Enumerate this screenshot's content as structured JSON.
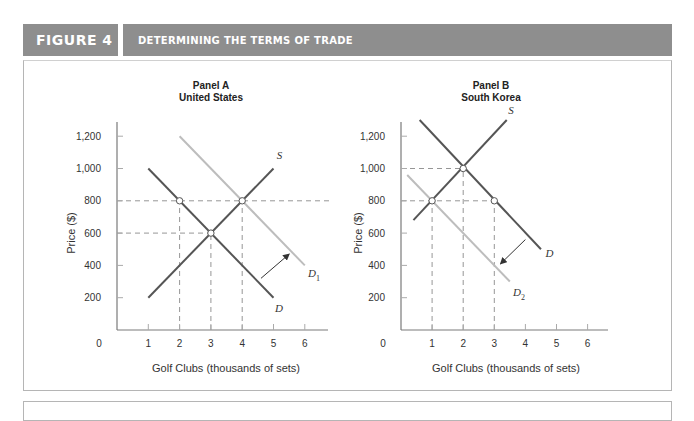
{
  "header": {
    "figure_label": "FIGURE 4",
    "title": "DETERMINING THE TERMS OF TRADE"
  },
  "colors": {
    "header_bg": "#8e8e8e",
    "dark_curve": "#555555",
    "light_curve": "#bdbdbd",
    "axis": "#7a7a7a",
    "dashed": "#8a8a8a"
  },
  "chart_data": [
    {
      "type": "line",
      "title": "Panel A",
      "subtitle": "United States",
      "xlabel": "Golf Clubs (thousands of sets)",
      "ylabel": "Price ($)",
      "xlim": [
        0,
        6.8
      ],
      "ylim": [
        0,
        1300
      ],
      "xticks": [
        0,
        1,
        2,
        3,
        4,
        5,
        6
      ],
      "yticks": [
        200,
        400,
        600,
        800,
        1000,
        1200
      ],
      "ytick_labels": [
        "200",
        "400",
        "600",
        "800",
        "1,000",
        "1,200"
      ],
      "grid": false,
      "series": [
        {
          "name": "S",
          "style": "dark",
          "points": [
            [
              1,
              200
            ],
            [
              5,
              1000
            ]
          ],
          "label_pos": [
            5.1,
            1060
          ]
        },
        {
          "name": "D",
          "style": "dark",
          "points": [
            [
              1,
              1000
            ],
            [
              5,
              200
            ]
          ],
          "label_pos": [
            5.05,
            110
          ]
        },
        {
          "name": "D1",
          "label_main": "D",
          "label_sub": "1",
          "style": "light",
          "points": [
            [
              2,
              1200
            ],
            [
              6,
              400
            ]
          ],
          "label_pos": [
            6.1,
            330
          ]
        }
      ],
      "points_of_interest": [
        {
          "x": 2,
          "y": 800,
          "label": "domestic demand at world price"
        },
        {
          "x": 3,
          "y": 600,
          "label": "no-trade equilibrium"
        },
        {
          "x": 4,
          "y": 800,
          "label": "new equilibrium / supply at world price"
        }
      ],
      "guides": {
        "horizontal": [
          {
            "y": 800,
            "from_x": 0,
            "to_x": 6.8
          },
          {
            "y": 600,
            "from_x": 0,
            "to_x": 3
          }
        ],
        "vertical": [
          {
            "x": 2,
            "from_y": 0,
            "to_y": 800
          },
          {
            "x": 3,
            "from_y": 0,
            "to_y": 600
          },
          {
            "x": 4,
            "from_y": 0,
            "to_y": 800
          }
        ]
      },
      "shift_arrow": {
        "from": [
          4.6,
          320
        ],
        "to": [
          5.5,
          470
        ],
        "direction": "right"
      }
    },
    {
      "type": "line",
      "title": "Panel B",
      "subtitle": "South Korea",
      "xlabel": "Golf Clubs (thousands of sets)",
      "ylabel": "Price ($)",
      "xlim": [
        0,
        6.8
      ],
      "ylim": [
        0,
        1300
      ],
      "xticks": [
        0,
        1,
        2,
        3,
        4,
        5,
        6
      ],
      "yticks": [
        200,
        400,
        600,
        800,
        1000,
        1200
      ],
      "ytick_labels": [
        "200",
        "400",
        "600",
        "800",
        "1,000",
        "1,200"
      ],
      "grid": false,
      "series": [
        {
          "name": "S",
          "style": "dark",
          "points": [
            [
              0.4,
              680
            ],
            [
              3.4,
              1300
            ]
          ],
          "label_pos": [
            3.45,
            1340
          ]
        },
        {
          "name": "D",
          "style": "dark",
          "points": [
            [
              0.6,
              1300
            ],
            [
              4.5,
              500
            ]
          ],
          "label_pos": [
            4.65,
            450
          ]
        },
        {
          "name": "D2",
          "label_main": "D",
          "label_sub": "2",
          "style": "light",
          "points": [
            [
              0.2,
              960
            ],
            [
              3.5,
              300
            ]
          ],
          "label_pos": [
            3.6,
            210
          ]
        }
      ],
      "points_of_interest": [
        {
          "x": 1,
          "y": 800,
          "label": "supply at world price"
        },
        {
          "x": 2,
          "y": 1000,
          "label": "no-trade equilibrium"
        },
        {
          "x": 3,
          "y": 800,
          "label": "domestic demand at world price"
        }
      ],
      "guides": {
        "horizontal": [
          {
            "y": 1000,
            "from_x": 0,
            "to_x": 2
          },
          {
            "y": 800,
            "from_x": 0,
            "to_x": 3
          }
        ],
        "vertical": [
          {
            "x": 1,
            "from_y": 0,
            "to_y": 800
          },
          {
            "x": 2,
            "from_y": 0,
            "to_y": 1000
          },
          {
            "x": 3,
            "from_y": 0,
            "to_y": 800
          }
        ]
      },
      "shift_arrow": {
        "from": [
          4.0,
          560
        ],
        "to": [
          3.2,
          410
        ],
        "direction": "left"
      }
    }
  ],
  "panels": {
    "a": {
      "title": "Panel A",
      "subtitle": "United States",
      "ylabel": "Price ($)",
      "xlabel": "Golf Clubs (thousands of sets)"
    },
    "b": {
      "title": "Panel B",
      "subtitle": "South Korea",
      "ylabel": "Price ($)",
      "xlabel": "Golf Clubs (thousands of sets)"
    }
  }
}
